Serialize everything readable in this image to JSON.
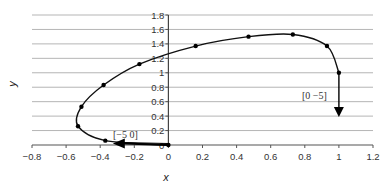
{
  "chart_data": {
    "type": "line",
    "title": "",
    "xlabel": "x",
    "ylabel": "y",
    "xlim": [
      -0.8,
      1.2
    ],
    "ylim": [
      0,
      1.8
    ],
    "grid": {
      "horizontal": true,
      "vertical": false
    },
    "legend": null,
    "x_ticks": [
      "-0.8",
      "-0.6",
      "-0.4",
      "-0.2",
      "0",
      "0.2",
      "0.4",
      "0.6",
      "0.8",
      "1",
      "1.2"
    ],
    "y_ticks": [
      "0",
      "0.2",
      "0.4",
      "0.6",
      "0.8",
      "1",
      "1.2",
      "1.4",
      "1.6",
      "1.8"
    ],
    "series": [
      {
        "name": "trajectory",
        "style": "smooth line with point markers",
        "points": [
          {
            "x": 1.0,
            "y": 1.0
          },
          {
            "x": 0.93,
            "y": 1.37
          },
          {
            "x": 0.73,
            "y": 1.53
          },
          {
            "x": 0.47,
            "y": 1.5
          },
          {
            "x": 0.16,
            "y": 1.37
          },
          {
            "x": -0.17,
            "y": 1.12
          },
          {
            "x": -0.38,
            "y": 0.83
          },
          {
            "x": -0.51,
            "y": 0.53
          },
          {
            "x": -0.53,
            "y": 0.26
          },
          {
            "x": -0.37,
            "y": 0.06
          },
          {
            "x": 0.0,
            "y": 0.0
          }
        ]
      }
    ],
    "annotations": [
      {
        "text": "[0   −5]",
        "type": "vector-arrow",
        "from": {
          "x": 1.0,
          "y": 1.0
        },
        "to": {
          "x": 1.0,
          "y": 0.4
        },
        "direction": "down"
      },
      {
        "text": "[−5   0]",
        "type": "vector-arrow",
        "from": {
          "x": 0.0,
          "y": 0.0
        },
        "to": {
          "x": -0.32,
          "y": 0.02
        },
        "direction": "left"
      }
    ]
  },
  "axes": {
    "x_title": "x",
    "y_title": "y"
  },
  "labels": {
    "vec_down": "[0   −5]",
    "vec_left": "[−5   0]"
  }
}
